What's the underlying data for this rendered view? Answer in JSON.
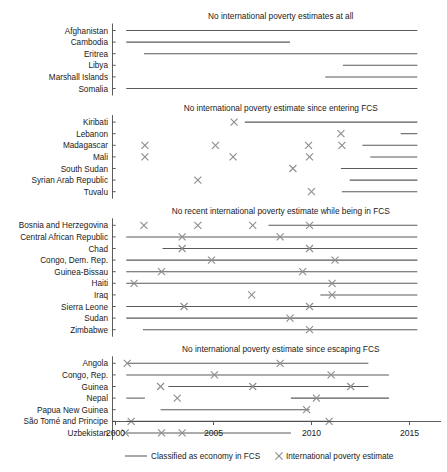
{
  "chart_data": {
    "type": "table",
    "title": "",
    "xlabel": "",
    "ylabel": "",
    "xlim": [
      1999.2,
      2016.6
    ],
    "grid": false,
    "legend_position": "bottom",
    "x_ticks": [
      2000,
      2005,
      2010,
      2015
    ],
    "x_tick_labels": [
      "2000",
      "2005",
      "2010",
      "2015"
    ],
    "legend": [
      {
        "key": "line",
        "label": "Classified as economy in FCS",
        "color": "#5a5a5a",
        "marker": "line"
      },
      {
        "key": "x",
        "label": "International poverty estimate",
        "color": "#8f8f8f",
        "marker": "x"
      }
    ],
    "panels": [
      {
        "title": "No international poverty estimates at all",
        "rows": [
          {
            "label": "Afghanistan",
            "spans": [
              [
                2000.55,
                2015.4
              ]
            ],
            "estimates": []
          },
          {
            "label": "Cambodia",
            "spans": [
              [
                2000.55,
                2008.9
              ]
            ],
            "estimates": []
          },
          {
            "label": "Eritrea",
            "spans": [
              [
                2001.45,
                2015.4
              ]
            ],
            "estimates": []
          },
          {
            "label": "Libya",
            "spans": [
              [
                2011.6,
                2015.4
              ]
            ],
            "estimates": []
          },
          {
            "label": "Marshall Islands",
            "spans": [
              [
                2010.7,
                2015.4
              ]
            ],
            "estimates": []
          },
          {
            "label": "Somalia",
            "spans": [
              [
                2000.55,
                2015.4
              ]
            ],
            "estimates": []
          }
        ]
      },
      {
        "title": "No international poverty estimate since entering FCS",
        "rows": [
          {
            "label": "Kiribati",
            "spans": [
              [
                2006.6,
                2015.4
              ]
            ],
            "estimates": [
              2006.05
            ]
          },
          {
            "label": "Lebanon",
            "spans": [
              [
                2014.55,
                2015.4
              ]
            ],
            "estimates": [
              2011.5
            ]
          },
          {
            "label": "Madagascar",
            "spans": [
              [
                2012.6,
                2015.4
              ]
            ],
            "estimates": [
              2001.5,
              2005.1,
              2009.85,
              2011.55
            ]
          },
          {
            "label": "Mali",
            "spans": [
              [
                2013.0,
                2015.4
              ]
            ],
            "estimates": [
              2001.5,
              2006.0,
              2009.9
            ]
          },
          {
            "label": "South Sudan",
            "spans": [
              [
                2011.5,
                2015.4
              ]
            ],
            "estimates": [
              2009.05
            ]
          },
          {
            "label": "Syrian Arab Republic",
            "spans": [
              [
                2011.95,
                2015.4
              ]
            ],
            "estimates": [
              2004.2
            ]
          },
          {
            "label": "Tuvalu",
            "spans": [
              [
                2011.55,
                2015.4
              ]
            ],
            "estimates": [
              2010.0
            ]
          }
        ]
      },
      {
        "title": "No recent international poverty estimate while being in FCS",
        "rows": [
          {
            "label": "Bosnia and Herzegovina",
            "spans": [
              [
                2007.8,
                2015.4
              ]
            ],
            "estimates": [
              2001.45,
              2004.2,
              2007.0,
              2009.9
            ]
          },
          {
            "label": "Central African Republic",
            "spans": [
              [
                2000.55,
                2015.4
              ]
            ],
            "estimates": [
              2003.4,
              2008.4
            ]
          },
          {
            "label": "Chad",
            "spans": [
              [
                2002.4,
                2015.4
              ]
            ],
            "estimates": [
              2003.4,
              2009.9
            ]
          },
          {
            "label": "Congo, Dem. Rep.",
            "spans": [
              [
                2000.55,
                2015.4
              ]
            ],
            "estimates": [
              2004.9,
              2011.2
            ]
          },
          {
            "label": "Guinea-Bissau",
            "spans": [
              [
                2000.55,
                2015.4
              ]
            ],
            "estimates": [
              2002.35,
              2009.55
            ]
          },
          {
            "label": "Haiti",
            "spans": [
              [
                2000.55,
                2015.4
              ]
            ],
            "estimates": [
              2000.95,
              2011.05
            ]
          },
          {
            "label": "Iraq",
            "spans": [
              [
                2010.45,
                2015.4
              ]
            ],
            "estimates": [
              2006.95,
              2011.05
            ]
          },
          {
            "label": "Sierra Leone",
            "spans": [
              [
                2000.55,
                2015.4
              ]
            ],
            "estimates": [
              2003.5,
              2009.9
            ]
          },
          {
            "label": "Sudan",
            "spans": [
              [
                2000.55,
                2015.4
              ]
            ],
            "estimates": [
              2008.9
            ]
          },
          {
            "label": "Zimbabwe",
            "spans": [
              [
                2001.4,
                2015.4
              ]
            ],
            "estimates": [
              2009.9
            ]
          }
        ]
      },
      {
        "title": "No international poverty estimate since escaping FCS",
        "rows": [
          {
            "label": "Angola",
            "spans": [
              [
                2000.55,
                2012.9
              ]
            ],
            "estimates": [
              2000.6,
              2008.4
            ]
          },
          {
            "label": "Congo, Rep.",
            "spans": [
              [
                2000.55,
                2013.95
              ]
            ],
            "estimates": [
              2005.05,
              2011.0
            ]
          },
          {
            "label": "Guinea",
            "spans": [
              [
                2002.7,
                2012.9
              ]
            ],
            "estimates": [
              2002.3,
              2007.0,
              2012.0
            ]
          },
          {
            "label": "Nepal",
            "spans": [
              [
                2000.55,
                2001.5
              ],
              [
                2008.95,
                2013.95
              ]
            ],
            "estimates": [
              2003.15,
              2010.25
            ]
          },
          {
            "label": "Papua New Guinea",
            "spans": [
              [
                2002.3,
                2009.9
              ]
            ],
            "estimates": [
              2009.75
            ]
          },
          {
            "label": "São Tomé and Principe",
            "spans": [
              [
                2000.55,
                2011.0
              ]
            ],
            "estimates": [
              2000.8,
              2010.9
            ]
          },
          {
            "label": "Uzbekistan",
            "spans": [
              [
                2000.55,
                2008.95
              ]
            ],
            "estimates": [
              2000.5,
              2002.35,
              2003.4
            ]
          }
        ]
      }
    ]
  }
}
